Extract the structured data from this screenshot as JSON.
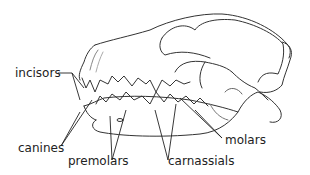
{
  "diagram": {
    "labels": {
      "incisors": "incisors",
      "canines": "canines",
      "premolars": "premolars",
      "carnassials": "carnassials",
      "molars": "molars"
    }
  }
}
